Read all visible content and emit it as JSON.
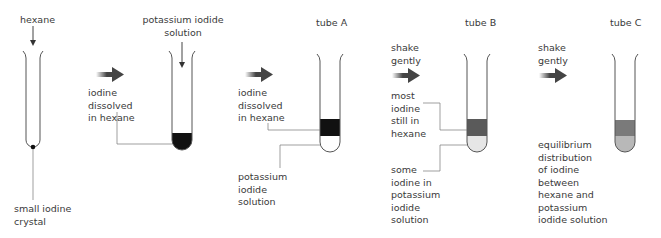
{
  "stages": [
    {
      "id": "start",
      "top_label": "hexane",
      "annotation": [
        "small iodine",
        "crystal"
      ]
    },
    {
      "id": "add_ki",
      "top_label": [
        "potassium iodide",
        "solution"
      ],
      "arrow_label": [
        "iodine",
        "dissolved",
        "in hexane"
      ]
    },
    {
      "id": "tube_a",
      "top_label": "tube A",
      "arrow_label": [
        "iodine",
        "dissolved",
        "in hexane"
      ],
      "annotation": [
        "potassium",
        "iodide",
        "solution"
      ]
    },
    {
      "id": "tube_b",
      "top_label": "tube B",
      "arrow_label": [
        "shake",
        "gently"
      ],
      "annotation_upper": [
        "most",
        "iodine",
        "still in",
        "hexane"
      ],
      "annotation_lower": [
        "some",
        "iodine in",
        "potassium",
        "iodide",
        "solution"
      ]
    },
    {
      "id": "tube_c",
      "top_label": "tube C",
      "arrow_label": [
        "shake",
        "gently"
      ],
      "annotation": [
        "equilibrium",
        "distribution",
        "of iodine",
        "between",
        "hexane and",
        "potassium",
        "iodide solution"
      ]
    }
  ],
  "colors": {
    "outline": "#555555",
    "iodine_dark": "#111111",
    "hexane_tube_b": "#5a5a5a",
    "ki_tube_b": "#e6e6e6",
    "hexane_tube_c": "#7a7a7a",
    "ki_tube_c": "#b8b8b8",
    "arrow": "#444444"
  }
}
